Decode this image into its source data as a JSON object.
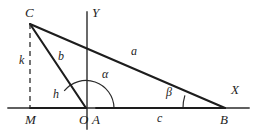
{
  "figure": {
    "background_color": "#ffffff",
    "stroke_color": "#1d1d1d",
    "axis_color": "#2a2a2a",
    "width": 257,
    "height": 136,
    "vertices": [
      {
        "id": "C",
        "label": "C",
        "x": 30,
        "y": 24,
        "label_x": 25,
        "label_y": 6
      },
      {
        "id": "M",
        "label": "M",
        "x": 30,
        "y": 108,
        "label_x": 25,
        "label_y": 113
      },
      {
        "id": "O",
        "label": "O",
        "x": 86,
        "y": 108,
        "label_x": 79,
        "label_y": 113
      },
      {
        "id": "A",
        "label": "A",
        "x": 96,
        "y": 108,
        "label_x": 92,
        "label_y": 113
      },
      {
        "id": "B",
        "label": "B",
        "x": 225,
        "y": 108,
        "label_x": 220,
        "label_y": 113
      }
    ],
    "axes": [
      {
        "id": "x-axis",
        "label": "X",
        "label_x": 231,
        "label_y": 83,
        "x1": 8,
        "y1": 108,
        "x2": 249,
        "y2": 108
      },
      {
        "id": "y-axis",
        "label": "Y",
        "label_x": 92,
        "label_y": 6,
        "x1": 87,
        "y1": 12,
        "x2": 87,
        "y2": 129
      }
    ],
    "segments": [
      {
        "id": "side-a",
        "label": "a",
        "from": "C",
        "to": "B",
        "style": "solid",
        "label_x": 131,
        "label_y": 45
      },
      {
        "id": "side-b",
        "label": "b",
        "from": "C",
        "to": "O",
        "style": "solid",
        "label_x": 58,
        "label_y": 50
      },
      {
        "id": "side-h",
        "label": "h",
        "from": "M",
        "to": "O",
        "style": "solid",
        "label_x": 53,
        "label_y": 88
      },
      {
        "id": "side-k",
        "label": "k",
        "from": "C",
        "to": "M",
        "style": "dashed",
        "label_x": 19,
        "label_y": 54
      },
      {
        "id": "side-c",
        "label": "c",
        "from": "A",
        "to": "B",
        "style": "solid",
        "label_x": 157,
        "label_y": 112
      }
    ],
    "angles": [
      {
        "id": "alpha",
        "label": "α",
        "vertex": "O",
        "radius": 28,
        "label_x": 102,
        "label_y": 68
      },
      {
        "id": "beta",
        "label": "β",
        "vertex": "B",
        "radius": 42,
        "label_x": 166,
        "label_y": 86
      }
    ]
  }
}
